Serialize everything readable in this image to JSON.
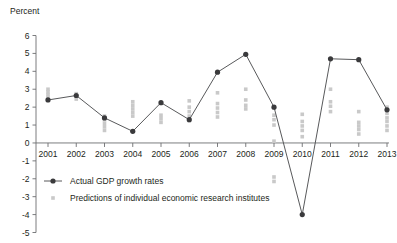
{
  "chart_data": {
    "type": "line",
    "title": "",
    "ylabel": "Percent",
    "xlabel": "",
    "ylim": [
      -5,
      6
    ],
    "yticks": [
      6,
      5,
      4,
      3,
      2,
      1,
      0,
      -1,
      -2,
      -3,
      -4,
      -5
    ],
    "ytick_labels": [
      "6",
      "5",
      "4",
      "3",
      "2",
      "1",
      "0",
      "-1",
      "-2",
      "-3",
      "-4",
      "-5"
    ],
    "categories": [
      "2001",
      "2002",
      "2003",
      "2004",
      "2005",
      "2006",
      "2007",
      "2008",
      "2009",
      "2010",
      "2011",
      "2012",
      "2013"
    ],
    "grid": false,
    "zero_line": true,
    "legend_position": "bottom-left",
    "colors": {
      "actual_line": "#58595b",
      "actual_marker": "#3a3a3c",
      "prediction_marker": "#c9c9c9",
      "axis": "#6d6e71",
      "text": "#231f20"
    },
    "series": [
      {
        "name": "Actual GDP growth rates",
        "type": "line",
        "marker": "filled-circle",
        "values": [
          2.4,
          2.65,
          1.4,
          0.65,
          2.25,
          1.3,
          3.95,
          4.95,
          2.0,
          -4.0,
          4.7,
          4.65,
          1.85
        ]
      },
      {
        "name": "Predictions of individual economic research institutes",
        "type": "scatter",
        "marker": "small-square",
        "points_by_year": {
          "2001": [
            3.0,
            2.85,
            2.7,
            2.55,
            2.4
          ],
          "2002": [
            2.75,
            2.6,
            2.45
          ],
          "2003": [
            1.5,
            1.3,
            1.1,
            0.9,
            0.7
          ],
          "2004": [
            2.3,
            2.1,
            1.9,
            1.7,
            1.5
          ],
          "2005": [
            1.55,
            1.35,
            1.15
          ],
          "2006": [
            2.35,
            2.0,
            1.75,
            1.5,
            1.25
          ],
          "2007": [
            2.8,
            2.2,
            1.95,
            1.7,
            1.45
          ],
          "2008": [
            3.0,
            2.4,
            2.1,
            1.9
          ],
          "2009": [
            1.55,
            1.3,
            1.0,
            0.1,
            -1.9,
            -2.15
          ],
          "2010": [
            1.6,
            1.2,
            0.95,
            0.7,
            0.35
          ],
          "2011": [
            3.0,
            2.3,
            2.05,
            1.75
          ],
          "2012": [
            1.75,
            1.15,
            0.95,
            0.75,
            0.5
          ],
          "2013": [
            2.0,
            1.65,
            1.4,
            1.2,
            0.95,
            0.7
          ]
        }
      }
    ],
    "legend": [
      {
        "label": "Actual GDP growth rates",
        "marker": "line-with-dot",
        "color": "#3a3a3c"
      },
      {
        "label": "Predictions of individual economic research institutes",
        "marker": "small-square",
        "color": "#c9c9c9"
      }
    ]
  }
}
